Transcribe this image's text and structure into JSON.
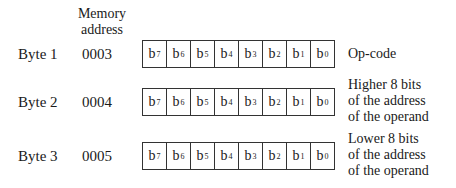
{
  "header": {
    "memory_address_line1": "Memory",
    "memory_address_line2": "address"
  },
  "bits": [
    {
      "base": "b",
      "sub": "7"
    },
    {
      "base": "b",
      "sub": "6"
    },
    {
      "base": "b",
      "sub": "5"
    },
    {
      "base": "b",
      "sub": "4"
    },
    {
      "base": "b",
      "sub": "3"
    },
    {
      "base": "b",
      "sub": "2"
    },
    {
      "base": "b",
      "sub": "1"
    },
    {
      "base": "b",
      "sub": "0"
    }
  ],
  "rows": [
    {
      "byte": "Byte 1",
      "address": "0003",
      "description": [
        "Op-code"
      ]
    },
    {
      "byte": "Byte 2",
      "address": "0004",
      "description": [
        "Higher 8 bits",
        "of the address",
        "of the operand"
      ]
    },
    {
      "byte": "Byte 3",
      "address": "0005",
      "description": [
        "Lower 8 bits",
        "of the address",
        "of the operand"
      ]
    }
  ]
}
